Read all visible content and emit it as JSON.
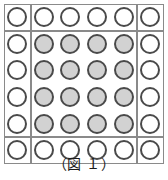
{
  "figure": {
    "caption": "（図 １）",
    "caption_label": "図",
    "caption_number": "１",
    "grid": {
      "rows": 6,
      "cols": 6,
      "total_circles": 36,
      "empty_circles": 20,
      "filled_circles": 16,
      "states": [
        [
          "empty",
          "empty",
          "empty",
          "empty",
          "empty",
          "empty"
        ],
        [
          "empty",
          "filled",
          "filled",
          "filled",
          "filled",
          "empty"
        ],
        [
          "empty",
          "filled",
          "filled",
          "filled",
          "filled",
          "empty"
        ],
        [
          "empty",
          "filled",
          "filled",
          "filled",
          "filled",
          "empty"
        ],
        [
          "empty",
          "filled",
          "filled",
          "filled",
          "filled",
          "empty"
        ],
        [
          "empty",
          "empty",
          "empty",
          "empty",
          "empty",
          "empty"
        ]
      ]
    },
    "regions": [
      {
        "name": "corner-top-left",
        "row": 0,
        "col": 0,
        "row_span": 1,
        "col_span": 1
      },
      {
        "name": "edge-top",
        "row": 0,
        "col": 1,
        "row_span": 1,
        "col_span": 4
      },
      {
        "name": "corner-top-right",
        "row": 0,
        "col": 5,
        "row_span": 1,
        "col_span": 1
      },
      {
        "name": "edge-left",
        "row": 1,
        "col": 0,
        "row_span": 4,
        "col_span": 1
      },
      {
        "name": "center-block",
        "row": 1,
        "col": 1,
        "row_span": 4,
        "col_span": 4
      },
      {
        "name": "edge-right",
        "row": 1,
        "col": 5,
        "row_span": 4,
        "col_span": 1
      },
      {
        "name": "corner-bottom-left",
        "row": 5,
        "col": 0,
        "row_span": 1,
        "col_span": 1
      },
      {
        "name": "edge-bottom",
        "row": 5,
        "col": 1,
        "row_span": 1,
        "col_span": 4
      },
      {
        "name": "corner-bottom-right",
        "row": 5,
        "col": 5,
        "row_span": 1,
        "col_span": 1
      }
    ],
    "colors": {
      "border": "#8a8a8a",
      "circle_outline": "#4a4a4a",
      "circle_fill_empty": "#ffffff",
      "circle_fill_filled": "#d2d2d2",
      "background": "#ffffff",
      "caption_text": "#1a1a1a"
    },
    "metrics": {
      "cell_size": 26.6,
      "circle_diameter": 20,
      "diagram_left": 4,
      "diagram_top": 4
    }
  }
}
